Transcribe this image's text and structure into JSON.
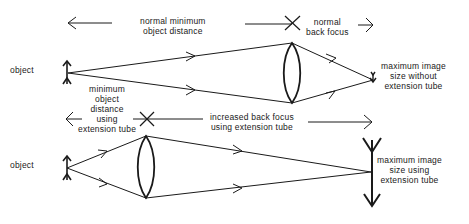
{
  "diagram": {
    "top": {
      "object_label": "object",
      "normal_min_distance": [
        "normal minimum",
        "object distance"
      ],
      "normal_back_focus": [
        "normal",
        "back focus"
      ],
      "image_label": [
        "maximum image",
        "size without",
        "extension tube"
      ]
    },
    "bottom": {
      "object_label": "object",
      "min_distance_ext": [
        "minimum",
        "object",
        "distance",
        "using",
        "extension tube"
      ],
      "increased_back_focus": [
        "increased back focus",
        "using extension tube"
      ],
      "image_label": [
        "maximum image",
        "size using",
        "extension tube"
      ]
    },
    "line_color": "#1a1a1a"
  }
}
